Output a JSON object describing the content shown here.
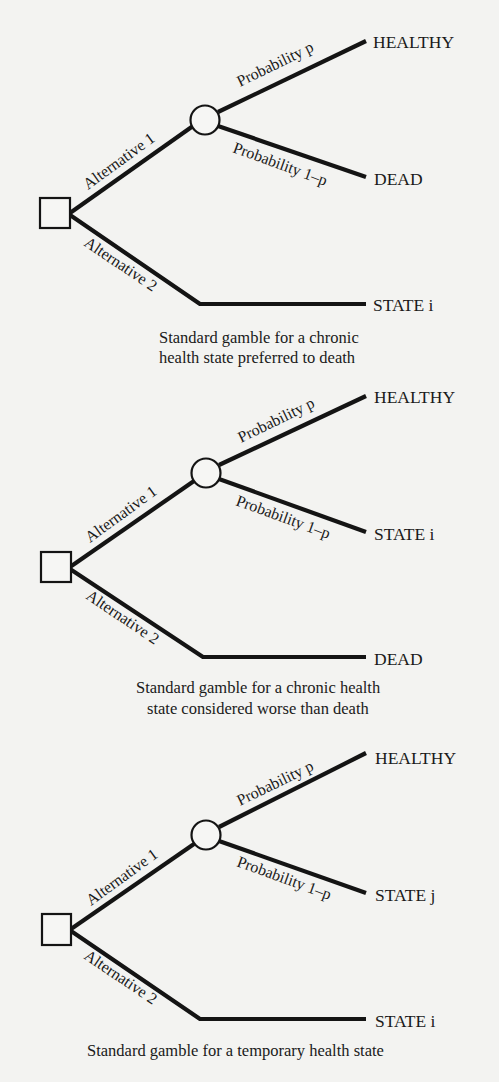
{
  "colors": {
    "background": "#f3f3f1",
    "line": "#141414",
    "text": "#1a1a1a"
  },
  "diagrams": [
    {
      "decision_node": "square",
      "chance_node": "circle",
      "alt1_label": "Alternative 1",
      "alt2_label": "Alternative 2",
      "prob_p_label": "Probability p",
      "prob_1mp_label": "Probability 1–p",
      "outcome_p": "HEALTHY",
      "outcome_1mp": "DEAD",
      "outcome_alt2": "STATE i",
      "caption_line1": "Standard gamble for a chronic",
      "caption_line2": "health state preferred to death"
    },
    {
      "decision_node": "square",
      "chance_node": "circle",
      "alt1_label": "Alternative 1",
      "alt2_label": "Alternative 2",
      "prob_p_label": "Probability p",
      "prob_1mp_label": "Probability 1–p",
      "outcome_p": "HEALTHY",
      "outcome_1mp": "STATE i",
      "outcome_alt2": "DEAD",
      "caption_line1": "Standard gamble for a chronic health",
      "caption_line2": "state considered worse than death"
    },
    {
      "decision_node": "square",
      "chance_node": "circle",
      "alt1_label": "Alternative 1",
      "alt2_label": "Alternative 2",
      "prob_p_label": "Probability p",
      "prob_1mp_label": "Probability 1–p",
      "outcome_p": "HEALTHY",
      "outcome_1mp": "STATE j",
      "outcome_alt2": "STATE i",
      "caption_line1": "Standard gamble for a temporary health state",
      "caption_line2": ""
    }
  ]
}
